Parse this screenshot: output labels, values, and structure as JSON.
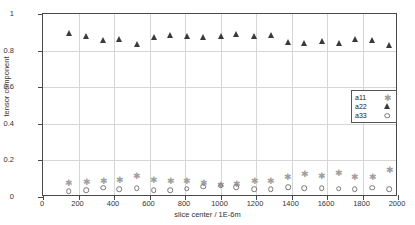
{
  "chart_data": {
    "type": "scatter",
    "title": "",
    "xlabel": "slice center / 1E-6m",
    "ylabel": "tensor component",
    "xlim": [
      0,
      2000
    ],
    "ylim": [
      0,
      1
    ],
    "xticks": [
      0,
      200,
      400,
      600,
      800,
      1000,
      1200,
      1400,
      1600,
      1800,
      2000
    ],
    "yticks": [
      0,
      0.2,
      0.4,
      0.6,
      0.8,
      1
    ],
    "grid": true,
    "legend_position": "center-right",
    "x": [
      145,
      243,
      340,
      430,
      527,
      623,
      718,
      810,
      902,
      1000,
      1090,
      1190,
      1283,
      1380,
      1472,
      1570,
      1667,
      1757,
      1855,
      1950
    ],
    "series": [
      {
        "name": "a11",
        "marker": "star",
        "color": "#a0a0a0",
        "values": [
          0.075,
          0.082,
          0.087,
          0.094,
          0.117,
          0.093,
          0.086,
          0.088,
          0.077,
          0.064,
          0.072,
          0.09,
          0.09,
          0.112,
          0.124,
          0.117,
          0.132,
          0.107,
          0.11,
          0.148
        ]
      },
      {
        "name": "a22",
        "marker": "triangle",
        "color": "#3a3a3a",
        "values": [
          0.888,
          0.874,
          0.853,
          0.859,
          0.833,
          0.868,
          0.878,
          0.874,
          0.871,
          0.877,
          0.886,
          0.874,
          0.881,
          0.84,
          0.836,
          0.846,
          0.838,
          0.86,
          0.855,
          0.827
        ]
      },
      {
        "name": "a33",
        "marker": "circle",
        "color": "#777777",
        "values": [
          0.031,
          0.036,
          0.05,
          0.044,
          0.047,
          0.038,
          0.038,
          0.045,
          0.056,
          0.061,
          0.053,
          0.043,
          0.042,
          0.054,
          0.048,
          0.047,
          0.045,
          0.043,
          0.05,
          0.043
        ]
      }
    ]
  },
  "legend": {
    "entries": [
      {
        "label": "a11"
      },
      {
        "label": "a22"
      },
      {
        "label": "a33"
      }
    ]
  }
}
